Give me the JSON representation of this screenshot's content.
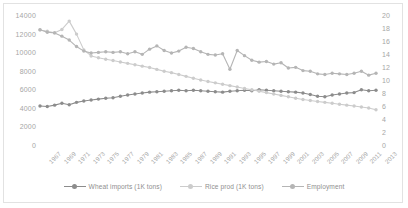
{
  "chart_data": {
    "type": "line",
    "title": "",
    "xlabel": "",
    "ylabel": "",
    "grid": false,
    "legend_position": "bottom",
    "x": [
      1967,
      1968,
      1969,
      1970,
      1971,
      1972,
      1973,
      1974,
      1975,
      1976,
      1977,
      1978,
      1979,
      1980,
      1981,
      1982,
      1983,
      1984,
      1985,
      1986,
      1987,
      1988,
      1989,
      1990,
      1991,
      1992,
      1993,
      1994,
      1995,
      1996,
      1997,
      1998,
      1999,
      2000,
      2001,
      2002,
      2003,
      2004,
      2005,
      2006,
      2007,
      2008,
      2009,
      2010,
      2011,
      2012,
      2013
    ],
    "xtick_labels": [
      "1967",
      "1969",
      "1971",
      "1973",
      "1975",
      "1977",
      "1979",
      "1981",
      "1983",
      "1985",
      "1987",
      "1989",
      "1991",
      "1993",
      "1995",
      "1997",
      "1999",
      "2001",
      "2003",
      "2005",
      "2007",
      "2009",
      "2011",
      "2013"
    ],
    "ylim": [
      0,
      14000
    ],
    "ytick_labels": [
      "0",
      "2000",
      "4000",
      "6000",
      "8000",
      "10000",
      "12000",
      "14000"
    ],
    "ytick_values": [
      0,
      2000,
      4000,
      6000,
      8000,
      10000,
      12000,
      14000
    ],
    "y2lim": [
      0,
      20
    ],
    "y2tick_labels": [
      "0",
      "2",
      "4",
      "6",
      "8",
      "10",
      "12",
      "14",
      "16",
      "18",
      "20"
    ],
    "y2tick_values": [
      0,
      2,
      4,
      6,
      8,
      10,
      12,
      14,
      16,
      18,
      20
    ],
    "series": [
      {
        "name": "Wheat imports (1K tons)",
        "axis": "left",
        "color": "#8c8c8c",
        "values": [
          4300,
          4250,
          4400,
          4600,
          4450,
          4700,
          4850,
          4950,
          5050,
          5150,
          5200,
          5350,
          5500,
          5600,
          5700,
          5800,
          5850,
          5900,
          5950,
          6000,
          5950,
          6000,
          5950,
          5900,
          5850,
          5800,
          5900,
          5950,
          6000,
          5950,
          6050,
          6000,
          5950,
          5900,
          5850,
          5800,
          5700,
          5550,
          5350,
          5300,
          5500,
          5600,
          5700,
          5750,
          6050,
          5950,
          6000
        ]
      },
      {
        "name": "Rice prod (1K tons)",
        "axis": "left",
        "color": "#cccccc",
        "values": [
          12500,
          12350,
          12200,
          12550,
          13450,
          12050,
          10350,
          9700,
          9500,
          9350,
          9200,
          9050,
          8900,
          8750,
          8600,
          8450,
          8250,
          8050,
          7900,
          7700,
          7500,
          7300,
          7100,
          6950,
          6800,
          6650,
          6500,
          6350,
          6200,
          6050,
          5900,
          5750,
          5600,
          5450,
          5300,
          5150,
          5000,
          4900,
          4800,
          4700,
          4600,
          4500,
          4400,
          4300,
          4200,
          4100,
          3900
        ]
      },
      {
        "name": "Employment",
        "axis": "right",
        "color": "#b5b5b5",
        "values": [
          17.9,
          17.5,
          17.4,
          16.9,
          16.3,
          15.3,
          14.6,
          14.3,
          14.4,
          14.5,
          14.4,
          14.5,
          14.2,
          14.5,
          14.1,
          14.9,
          15.4,
          14.7,
          14.3,
          14.6,
          15.2,
          15.0,
          14.5,
          14.1,
          14.0,
          14.2,
          11.8,
          14.7,
          13.9,
          13.2,
          12.9,
          13.0,
          12.6,
          12.8,
          12.0,
          12.1,
          11.6,
          11.5,
          11.1,
          11.0,
          11.2,
          11.1,
          11.0,
          11.2,
          11.5,
          10.9,
          11.2
        ]
      }
    ]
  },
  "legend": {
    "items": [
      {
        "label": "Wheat imports (1K tons)",
        "color": "#8c8c8c"
      },
      {
        "label": "Rice prod (1K tons)",
        "color": "#cccccc"
      },
      {
        "label": "Employment",
        "color": "#b5b5b5"
      }
    ]
  }
}
